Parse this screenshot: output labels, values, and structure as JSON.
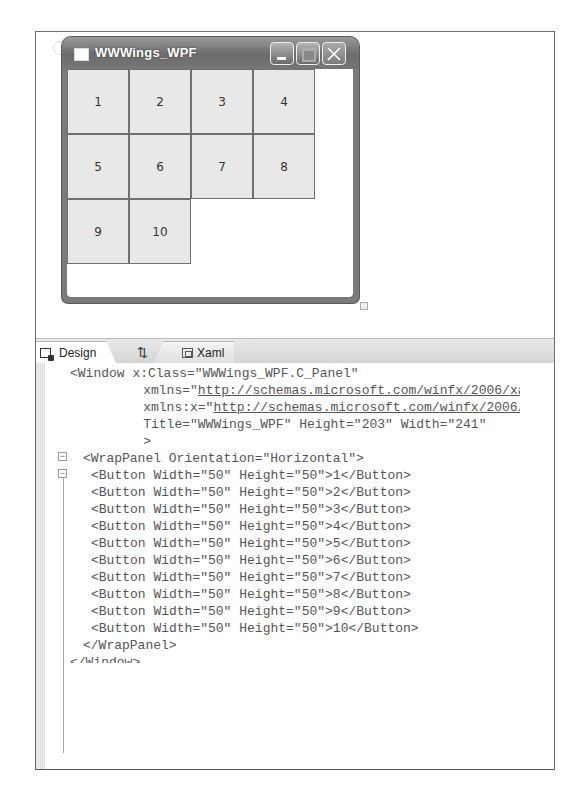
{
  "designer": {
    "window_title": "WWWings_WPF",
    "caption_buttons": [
      "minimize",
      "maximize",
      "close"
    ],
    "buttons": [
      "1",
      "2",
      "3",
      "4",
      "5",
      "6",
      "7",
      "8",
      "9",
      "10"
    ]
  },
  "tabs": {
    "design": "Design",
    "swap": "⇅",
    "xaml": "Xaml"
  },
  "code": {
    "lines": [
      "<Window x:Class=\"WWWings_WPF.C_Panel\"",
      "    xmlns=\"",
      "http://schemas.microsoft.com/winfx/2006/xaml/presentation",
      "\"",
      "    xmlns:x=\"",
      "http://schemas.microsoft.com/winfx/2006/xaml",
      "\"",
      "    Title=\"WWWings_WPF\" Height=\"203\" Width=\"241\"",
      "    >",
      "<WrapPanel Orientation=\"Horizontal\">",
      "<Button Width=\"50\" Height=\"50\">1</Button>",
      "<Button Width=\"50\" Height=\"50\">2</Button>",
      "<Button Width=\"50\" Height=\"50\">3</Button>",
      "<Button Width=\"50\" Height=\"50\">4</Button>",
      "<Button Width=\"50\" Height=\"50\">5</Button>",
      "<Button Width=\"50\" Height=\"50\">6</Button>",
      "<Button Width=\"50\" Height=\"50\">7</Button>",
      "<Button Width=\"50\" Height=\"50\">8</Button>",
      "<Button Width=\"50\" Height=\"50\">9</Button>",
      "<Button Width=\"50\" Height=\"50\">10</Button>",
      "</WrapPanel>",
      "</Window>"
    ]
  }
}
